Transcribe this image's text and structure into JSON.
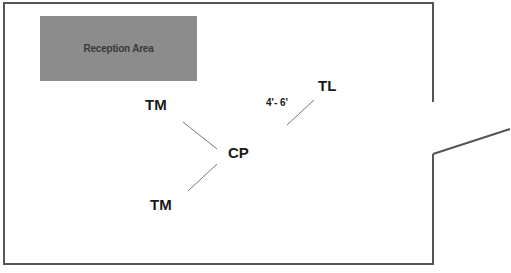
{
  "diagram": {
    "type": "floor-plan",
    "room": {
      "wall_color": "#555555",
      "door_opening": "right wall, angled door open outward"
    },
    "reception_area": {
      "label": "Reception Area",
      "fill": "#8c8c8c"
    },
    "positions": [
      {
        "id": "tm_top",
        "label": "TM"
      },
      {
        "id": "cp",
        "label": "CP"
      },
      {
        "id": "tm_bottom",
        "label": "TM"
      },
      {
        "id": "tl",
        "label": "TL"
      }
    ],
    "distance_label": "4'- 6'",
    "connectors": [
      {
        "from": "tm_top",
        "to": "cp"
      },
      {
        "from": "cp",
        "to": "tm_bottom"
      },
      {
        "from": "cp",
        "to": "tl"
      }
    ]
  }
}
